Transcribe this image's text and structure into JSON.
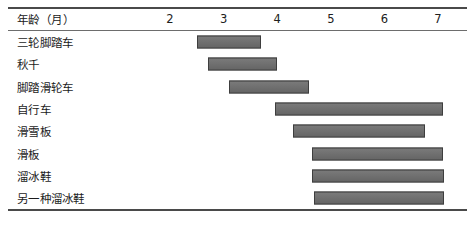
{
  "header": {
    "row_label": "年龄（月）",
    "ticks": [
      2,
      3,
      4,
      5,
      6,
      7
    ]
  },
  "style": {
    "bar_fill": "#6d6d6d",
    "bar_border": "#3e3e3e",
    "rule_color": "#4a4a4a",
    "background": "#ffffff"
  },
  "chart_data": {
    "type": "bar",
    "title": "",
    "xlabel": "年龄（月）",
    "ylabel": "",
    "orientation": "horizontal",
    "subtype": "gantt",
    "xlim": [
      1.5,
      7.6
    ],
    "xticks": [
      2,
      3,
      4,
      5,
      6,
      7
    ],
    "grid": false,
    "legend": false,
    "categories": [
      "三轮脚踏车",
      "秋千",
      "脚踏滑轮车",
      "自行车",
      "滑雪板",
      "滑板",
      "溜冰鞋",
      "另一种溜冰鞋"
    ],
    "bars": [
      {
        "label": "三轮脚踏车",
        "start": 2.5,
        "end": 3.7
      },
      {
        "label": "秋千",
        "start": 2.7,
        "end": 4.0
      },
      {
        "label": "脚踏滑轮车",
        "start": 3.1,
        "end": 4.6
      },
      {
        "label": "自行车",
        "start": 3.95,
        "end": 7.1
      },
      {
        "label": "滑雪板",
        "start": 4.3,
        "end": 6.75
      },
      {
        "label": "滑板",
        "start": 4.65,
        "end": 7.1
      },
      {
        "label": "溜冰鞋",
        "start": 4.65,
        "end": 7.12
      },
      {
        "label": "另一种溜冰鞋",
        "start": 4.68,
        "end": 7.12
      }
    ]
  }
}
